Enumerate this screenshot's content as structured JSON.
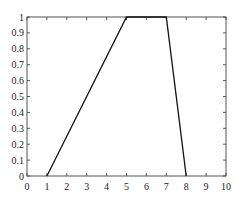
{
  "chart_data": {
    "type": "line",
    "title": "",
    "xlabel": "",
    "ylabel": "",
    "xlim": [
      0,
      10
    ],
    "ylim": [
      0,
      1
    ],
    "grid": false,
    "legend": null,
    "x_ticks": [
      "0",
      "1",
      "2",
      "3",
      "4",
      "5",
      "6",
      "7",
      "8",
      "9",
      "10"
    ],
    "y_ticks": [
      "0",
      "0.1",
      "0.2",
      "0.3",
      "0.4",
      "0.5",
      "0.6",
      "0.7",
      "0.8",
      "0.9",
      "1"
    ],
    "series": [
      {
        "name": "trapezoid membership",
        "color": "#111111",
        "x": [
          1,
          5,
          7,
          8
        ],
        "y": [
          0,
          1,
          1,
          0
        ]
      }
    ]
  }
}
